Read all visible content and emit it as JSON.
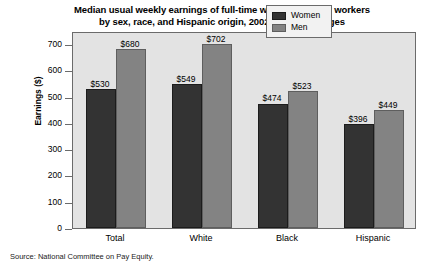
{
  "chart_data": {
    "type": "bar",
    "title": "Median usual weekly earnings of full-time wage and salary workers by sex, race, and Hispanic origin, 2002 annual averages",
    "title_lines": [
      "Median usual weekly earnings of full-time wage and salary workers",
      "by sex, race, and Hispanic origin, 2002 annual averages"
    ],
    "xlabel": "",
    "ylabel": "Earnings ($)",
    "ylim": [
      0,
      750
    ],
    "ytick_values": [
      0,
      100,
      200,
      300,
      400,
      500,
      600,
      700
    ],
    "ytick_labels": [
      "0",
      "100",
      "200",
      "300",
      "400",
      "500",
      "600",
      "700"
    ],
    "grid": false,
    "legend_position": "top-right",
    "categories": [
      "Total",
      "White",
      "Black",
      "Hispanic"
    ],
    "series": [
      {
        "name": "Women",
        "color": "#333333",
        "values": [
          530,
          549,
          474,
          396
        ],
        "value_labels": [
          "$530",
          "$549",
          "$474",
          "$396"
        ]
      },
      {
        "name": "Men",
        "color": "#838383",
        "values": [
          680,
          702,
          523,
          449
        ],
        "value_labels": [
          "$680",
          "$702",
          "$523",
          "$449"
        ]
      }
    ],
    "source": "Source: National Committee on Pay Equity.",
    "plot_background": "#e3e3e3",
    "axis_color": "#6b6b6b"
  }
}
